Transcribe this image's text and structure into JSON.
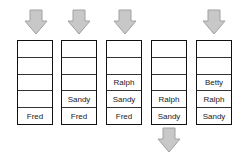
{
  "diagram": {
    "arrow_color": "#c8c8c8",
    "arrow_stroke": "#a0a0a0",
    "stacks": [
      {
        "cells": [
          "",
          "",
          "",
          "",
          "Fred"
        ],
        "arrow": "push"
      },
      {
        "cells": [
          "",
          "",
          "",
          "Sandy",
          "Fred"
        ],
        "arrow": "push"
      },
      {
        "cells": [
          "",
          "",
          "Ralph",
          "Sandy",
          "Fred"
        ],
        "arrow": "push"
      },
      {
        "cells": [
          "",
          "",
          "",
          "Ralph",
          "Sandy"
        ],
        "arrow": "pop"
      },
      {
        "cells": [
          "",
          "",
          "Betty",
          "Ralph",
          "Sandy"
        ],
        "arrow": "push"
      }
    ]
  }
}
